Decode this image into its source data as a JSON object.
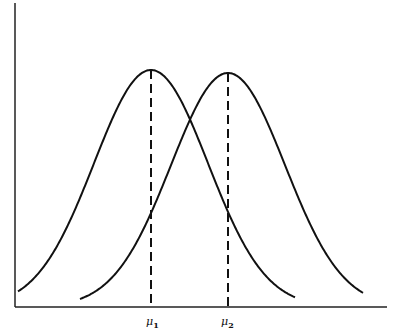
{
  "chart_data": {
    "type": "line",
    "title": "",
    "xlabel": "",
    "ylabel": "",
    "grid": false,
    "legend": null,
    "axes": {
      "x_ticks": [],
      "y_ticks": []
    },
    "series": [
      {
        "name": "distribution-1",
        "kind": "normal",
        "mean_label": "μ1",
        "mean_px": 151,
        "sigma_px": 57,
        "peak_height_px": 237,
        "x_start_px": 18,
        "x_end_px": 295
      },
      {
        "name": "distribution-2",
        "kind": "normal",
        "mean_label": "μ2",
        "mean_px": 228,
        "sigma_px": 57,
        "peak_height_px": 234,
        "x_start_px": 80,
        "x_end_px": 363
      }
    ],
    "annotations": [
      {
        "type": "dashed-vertical",
        "at": "μ1",
        "label": "μ",
        "subscript": "1"
      },
      {
        "type": "dashed-vertical",
        "at": "μ2",
        "label": "μ",
        "subscript": "2"
      }
    ]
  },
  "labels": {
    "mu1": {
      "symbol": "μ",
      "sub": "1"
    },
    "mu2": {
      "symbol": "μ",
      "sub": "2"
    }
  },
  "colors": {
    "line": "#111111",
    "axis": "#222222",
    "background": "#ffffff"
  }
}
